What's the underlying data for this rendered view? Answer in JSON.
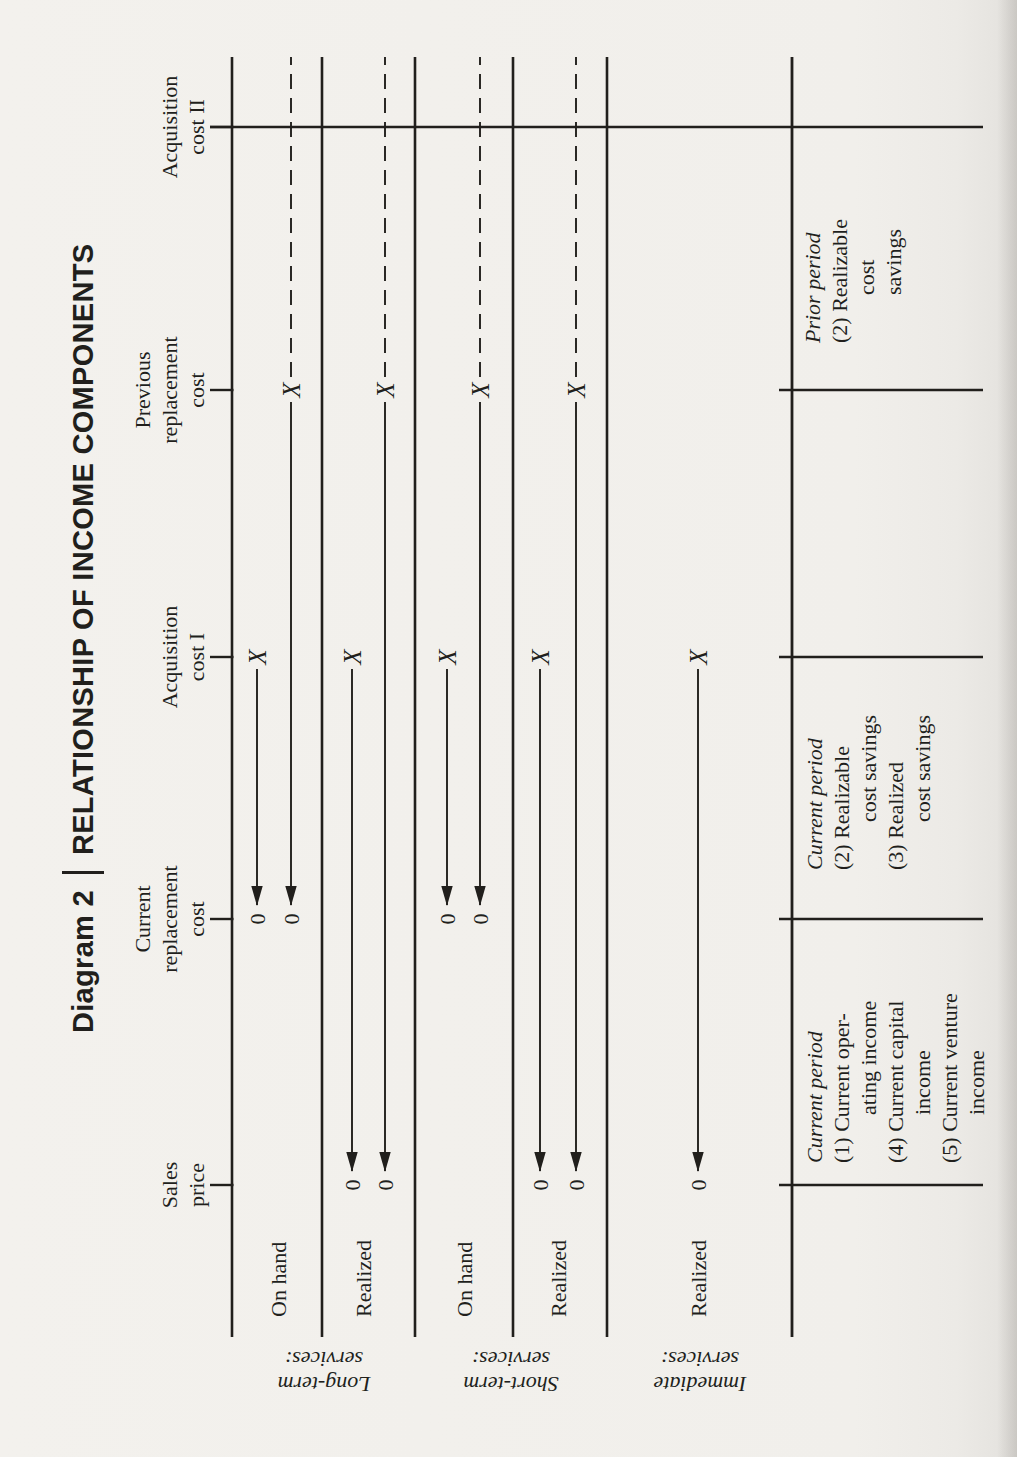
{
  "ink": "#211f1c",
  "paper": "#f1efeb",
  "title": {
    "prefix": "Diagram 2",
    "separator": "|",
    "text": "RELATIONSHIP OF INCOME COMPONENTS"
  },
  "marks": {
    "source": "X",
    "destination": "0"
  },
  "axis": {
    "y": 232,
    "x_start": 120,
    "x_end": 1400,
    "tick_top": 210,
    "points": [
      {
        "id": "sales-price",
        "lines": [
          "Sales",
          "price"
        ],
        "x": 272
      },
      {
        "id": "current-replacement-cost",
        "lines": [
          "Current",
          "replacement",
          "cost"
        ],
        "x": 538
      },
      {
        "id": "acquisition-cost-i",
        "lines": [
          "Acquisition",
          "cost I"
        ],
        "x": 800
      },
      {
        "id": "previous-replacement-cost",
        "lines": [
          "Previous",
          "replacement",
          "cost"
        ],
        "x": 1067
      },
      {
        "id": "acquisition-cost-ii",
        "lines": [
          "Acquisition",
          "cost II"
        ],
        "x": 1330,
        "drop_line_to": 983
      }
    ]
  },
  "separators": {
    "ys": [
      322,
      415,
      513,
      607
    ],
    "x_start": 120,
    "x_end": 1400
  },
  "sections": [
    {
      "id": "long-term",
      "label_lines": [
        "Long-term",
        "services:"
      ],
      "label_center_y": 324,
      "rows": [
        {
          "label": "On hand",
          "label_y": 278,
          "arrows": [
            {
              "y": 257,
              "from_x": 800,
              "to_x": 538,
              "dashed_tail": false
            },
            {
              "y": 291,
              "from_x": 1067,
              "to_x": 538,
              "dashed_tail": true
            }
          ]
        },
        {
          "label": "Realized",
          "label_y": 363,
          "arrows": [
            {
              "y": 352,
              "from_x": 800,
              "to_x": 272,
              "dashed_tail": false
            },
            {
              "y": 385,
              "from_x": 1067,
              "to_x": 272,
              "dashed_tail": true
            }
          ]
        }
      ]
    },
    {
      "id": "short-term",
      "label_lines": [
        "Short-term",
        "services:"
      ],
      "label_center_y": 511,
      "rows": [
        {
          "label": "On hand",
          "label_y": 464,
          "arrows": [
            {
              "y": 447,
              "from_x": 800,
              "to_x": 538,
              "dashed_tail": false
            },
            {
              "y": 480,
              "from_x": 1067,
              "to_x": 538,
              "dashed_tail": true
            }
          ]
        },
        {
          "label": "Realized",
          "label_y": 558,
          "arrows": [
            {
              "y": 540,
              "from_x": 800,
              "to_x": 272,
              "dashed_tail": false
            },
            {
              "y": 576,
              "from_x": 1067,
              "to_x": 272,
              "dashed_tail": true
            }
          ]
        }
      ]
    },
    {
      "id": "immediate",
      "label_lines": [
        "Immediate",
        "services:"
      ],
      "label_center_y": 700,
      "rows": [
        {
          "label": "Realized",
          "label_y": 698,
          "arrows": [
            {
              "y": 698,
              "from_x": 800,
              "to_x": 272,
              "dashed_tail": false
            }
          ]
        }
      ]
    }
  ],
  "table": {
    "top_rule_y": 792,
    "bottom_y": 983,
    "divider_top_y": 779,
    "divider_xs": [
      272,
      538,
      800,
      1067
    ],
    "cells": [
      {
        "id": "current-period-income",
        "x": 294,
        "first_baseline_y": 822,
        "lines": [
          {
            "text": "Current period",
            "italic": true,
            "indent": 0
          },
          {
            "text": "(1) Current oper-",
            "indent": 0
          },
          {
            "text": "ating income",
            "indent": 48
          },
          {
            "text": "(4) Current capital",
            "indent": 0
          },
          {
            "text": "income",
            "indent": 48
          },
          {
            "text": "(5) Current venture",
            "indent": 0
          },
          {
            "text": "income",
            "indent": 48
          }
        ]
      },
      {
        "id": "current-period-savings",
        "x": 587,
        "first_baseline_y": 822,
        "lines": [
          {
            "text": "Current period",
            "italic": true,
            "indent": 0
          },
          {
            "text": "(2) Realizable",
            "indent": 0
          },
          {
            "text": "cost savings",
            "indent": 48
          },
          {
            "text": "(3) Realized",
            "indent": 0
          },
          {
            "text": "cost savings",
            "indent": 48
          }
        ]
      },
      {
        "id": "prior-period-savings",
        "x": 1114,
        "first_baseline_y": 820,
        "lines": [
          {
            "text": "Prior period",
            "italic": true,
            "indent": 0
          },
          {
            "text": "(2) Realizable",
            "indent": 0
          },
          {
            "text": "cost",
            "indent": 48
          },
          {
            "text": "savings",
            "indent": 48
          }
        ]
      }
    ]
  },
  "text_style": {
    "font_size": 22,
    "line_height": 27,
    "header_last_baseline_y": 204,
    "row_label_x": 140
  }
}
